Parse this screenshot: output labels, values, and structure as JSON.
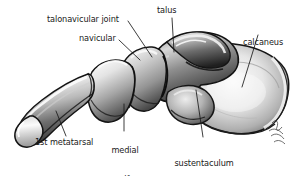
{
  "figure": {
    "view": "medial (arch) view of the right foot skeleton",
    "background_color": "#ffffff",
    "line_color": "#1a1a1a",
    "style": "grayscale airbrush medical illustration"
  },
  "labels": {
    "talonavicular_joint": "talonavicular joint",
    "navicular": "navicular",
    "talus": "talus",
    "calcaneus": "calcaneus",
    "first_metatarsal": "1st metatarsal",
    "medial_cuneiform_line1": "medial",
    "medial_cuneiform_line2": "cuneiform",
    "sustentaculum_tali_line1": "sustentaculum",
    "sustentaculum_tali_line2": "tali"
  },
  "signature": {
    "present": true,
    "description": "artist signature, lower right"
  },
  "bones": [
    {
      "name": "talus",
      "label": "talus"
    },
    {
      "name": "calcaneus",
      "label": "calcaneus"
    },
    {
      "name": "navicular",
      "label": "navicular"
    },
    {
      "name": "medial-cuneiform",
      "label": "medial cuneiform"
    },
    {
      "name": "first-metatarsal",
      "label": "1st metatarsal"
    },
    {
      "name": "sustentaculum-tali",
      "label": "sustentaculum tali"
    }
  ],
  "joints": [
    {
      "name": "talonavicular-joint",
      "label": "talonavicular joint"
    }
  ]
}
